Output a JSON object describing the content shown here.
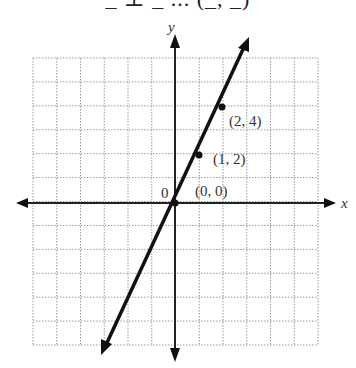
{
  "header": {
    "cut_text": "_ ⊥ _ ... (_, _)"
  },
  "chart_data": {
    "type": "line",
    "title": "",
    "xlabel": "x",
    "ylabel": "y",
    "xlim": [
      -6,
      6
    ],
    "ylim": [
      -6,
      6
    ],
    "grid": true,
    "origin_label": "0",
    "series": [
      {
        "name": "y = 2x",
        "x": [
          -3,
          0,
          1,
          2,
          3.1
        ],
        "y": [
          -6.1,
          0,
          2,
          4,
          6.6
        ]
      }
    ],
    "points": [
      {
        "x": 0,
        "y": 0,
        "label": "(0, 0)"
      },
      {
        "x": 1,
        "y": 2,
        "label": "(1, 2)"
      },
      {
        "x": 2,
        "y": 4,
        "label": "(2, 4)"
      }
    ]
  }
}
